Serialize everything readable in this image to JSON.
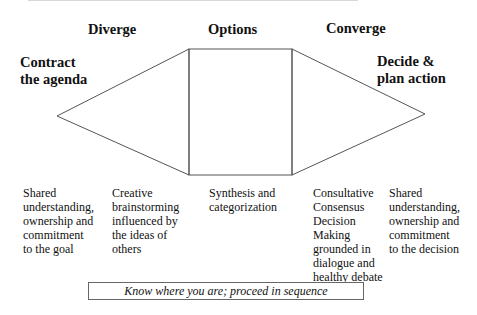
{
  "diagram": {
    "phases": [
      {
        "id": "contract",
        "label_lines": [
          "Contract",
          "the agenda"
        ]
      },
      {
        "id": "diverge",
        "label": "Diverge"
      },
      {
        "id": "options",
        "label": "Options"
      },
      {
        "id": "converge",
        "label": "Converge"
      },
      {
        "id": "decide",
        "label_lines": [
          "Decide &",
          "plan action"
        ]
      }
    ],
    "descriptions": [
      {
        "id": "contract",
        "text": "Shared\nunderstanding,\nownership and\ncommitment\nto the goal"
      },
      {
        "id": "diverge",
        "text": "Creative\nbrainstorming\n influenced by\nthe ideas of\nothers"
      },
      {
        "id": "options",
        "text": "Synthesis and\ncategorization"
      },
      {
        "id": "converge",
        "text": "Consultative\nConsensus\nDecision\nMaking\ngrounded in\ndialogue and\nhealthy debate"
      },
      {
        "id": "decide",
        "text": "Shared\nunderstanding,\nownership and\ncommitment\nto the decision"
      }
    ],
    "footer": "Know where you are; proceed in sequence",
    "colors": {
      "stroke": "#555555",
      "text": "#111111",
      "background": "#ffffff"
    }
  }
}
